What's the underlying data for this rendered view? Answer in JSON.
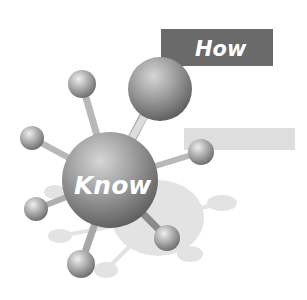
{
  "labels": {
    "how": "How",
    "know": "Know"
  },
  "colors": {
    "how_box": "#6a6a6a",
    "light_bar": "#dedede",
    "shadow": "#e3e3e3",
    "sphere_light": "#e8e8e8",
    "sphere_dark": "#7a7a7a"
  }
}
